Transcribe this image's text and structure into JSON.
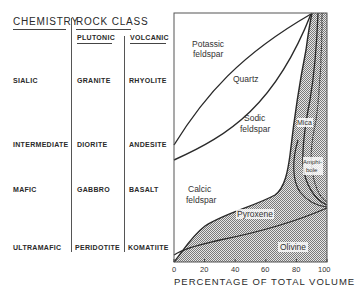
{
  "headers": {
    "chemistry": "CHEMISTRY",
    "rock_class": "ROCK CLASS",
    "plutonic": "PLUTONIC",
    "volcanic": "VOLCANIC"
  },
  "rows": [
    {
      "chemistry": "SIALIC",
      "plutonic": "GRANITE",
      "volcanic": "RHYOLITE"
    },
    {
      "chemistry": "INTERMEDIATE",
      "plutonic": "DIORITE",
      "volcanic": "ANDESITE"
    },
    {
      "chemistry": "MAFIC",
      "plutonic": "GABBRO",
      "volcanic": "BASALT"
    },
    {
      "chemistry": "ULTRAMAFIC",
      "plutonic": "PERIDOTITE",
      "volcanic": "KOMATIITE"
    }
  ],
  "chart": {
    "regions": {
      "potassic_1": "Potassic",
      "potassic_2": "feldspar",
      "quartz": "Quartz",
      "sodic_1": "Sodic",
      "sodic_2": "feldspar",
      "mica": "Mica",
      "amphibole_1": "Amphi-",
      "amphibole_2": "bole",
      "calcic_1": "Calcic",
      "calcic_2": "feldspar",
      "pyroxene": "Pyroxene",
      "olivine": "Olivine"
    },
    "x_ticks": [
      "0",
      "20",
      "40",
      "60",
      "80",
      "100"
    ],
    "x_axis_title": "PERCENTAGE OF TOTAL VOLUME",
    "colors": {
      "line": "#2a2a2a",
      "stipple": "#9a9a9a",
      "background": "#ffffff"
    }
  }
}
